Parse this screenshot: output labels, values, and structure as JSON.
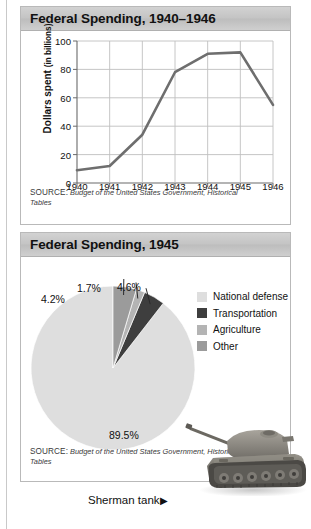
{
  "page": {
    "background": "#ffffff",
    "rule_color": "#c9c9c9"
  },
  "line_panel": {
    "title": "Federal Spending, 1940–1946",
    "source_label": "SOURCE:",
    "source_text": "Budget of the United States Government, Historical Tables"
  },
  "pie_panel": {
    "title": "Federal Spending, 1945",
    "source_label": "SOURCE:",
    "source_text": "Budget of the United States Government, Historical Tables"
  },
  "caption": {
    "text": "Sherman tank",
    "arrow": "▶",
    "image_name": "sherman-tank-photo"
  },
  "colors": {
    "line": "#6e6e6e",
    "grid": "#c0c0c0",
    "axis": "#6b6b6b",
    "national_defense": "#dedede",
    "transportation": "#3e3e3e",
    "agriculture": "#b4b4b4",
    "other": "#9b9b9b",
    "title_bar": "#c6c6c6"
  },
  "chart_data": [
    {
      "type": "line",
      "title": "Federal Spending, 1940–1946",
      "xlabel": "",
      "ylabel": "Dollars spent (in billions)",
      "ylabel_main": "Dollars spent",
      "ylabel_sub": "(in billions)",
      "categories": [
        "1940",
        "1941",
        "1942",
        "1943",
        "1944",
        "1945",
        "1946"
      ],
      "values": [
        9,
        12,
        34,
        78,
        91,
        92,
        55
      ],
      "ylim": [
        0,
        100
      ],
      "yticks": [
        0,
        20,
        40,
        60,
        80,
        100
      ],
      "grid": true,
      "legend": "none",
      "series": [
        {
          "name": "Dollars spent",
          "values": [
            9,
            12,
            34,
            78,
            91,
            92,
            55
          ]
        }
      ]
    },
    {
      "type": "pie",
      "title": "Federal Spending, 1945",
      "legend_position": "right",
      "labels": [
        "National defense",
        "Transportation",
        "Agriculture",
        "Other"
      ],
      "values": [
        89.5,
        4.2,
        1.7,
        4.6
      ],
      "value_labels": [
        "89.5%",
        "4.2%",
        "1.7%",
        "4.6%"
      ],
      "colors": [
        "#dedede",
        "#3e3e3e",
        "#b4b4b4",
        "#9b9b9b"
      ],
      "start_angle": 90,
      "direction": "counterclockwise"
    }
  ]
}
